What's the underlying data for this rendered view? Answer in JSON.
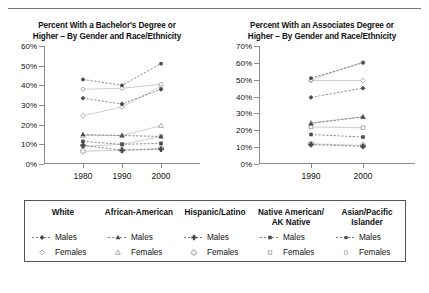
{
  "chart_data": [
    {
      "type": "line",
      "title": "Percent With a Bachelor's Degree or Higher – By Gender and Race/Ethnicity",
      "title_line1": "Percent With a Bachelor's Degree or",
      "title_line2": "Higher – By Gender and Race/Ethnicity",
      "xlabel": "",
      "ylabel": "",
      "x": [
        "1980",
        "1990",
        "2000"
      ],
      "ylim": [
        0,
        60
      ],
      "yticks": [
        0,
        10,
        20,
        30,
        40,
        50,
        60
      ],
      "ytick_labels": [
        "0%",
        "10%",
        "20%",
        "30%",
        "40%",
        "50%",
        "60%"
      ],
      "grid": false,
      "legend_position": "bottom-shared",
      "series": [
        {
          "name": "White Males",
          "group": "White",
          "gender": "Males",
          "marker": "diamond",
          "fill": "solid",
          "values": [
            33.5,
            30.5,
            38.0
          ]
        },
        {
          "name": "White Females",
          "group": "White",
          "gender": "Females",
          "marker": "diamond",
          "fill": "open",
          "values": [
            24.5,
            29.0,
            39.5
          ]
        },
        {
          "name": "African-American Males",
          "group": "African-American",
          "gender": "Males",
          "marker": "triangle",
          "fill": "solid",
          "values": [
            15.0,
            14.5,
            14.0
          ]
        },
        {
          "name": "African-American Females",
          "group": "African-American",
          "gender": "Females",
          "marker": "triangle",
          "fill": "open",
          "values": [
            14.5,
            14.5,
            19.5
          ]
        },
        {
          "name": "Hispanic/Latino Males",
          "group": "Hispanic/Latino",
          "gender": "Males",
          "marker": "cross",
          "fill": "solid",
          "values": [
            9.5,
            7.0,
            7.5
          ]
        },
        {
          "name": "Hispanic/Latino Females",
          "group": "Hispanic/Latino",
          "gender": "Females",
          "marker": "cross",
          "fill": "open",
          "values": [
            6.5,
            7.0,
            8.0
          ]
        },
        {
          "name": "Native American/AK Native Males",
          "group": "Native American/AK Native",
          "gender": "Males",
          "marker": "square",
          "fill": "solid",
          "values": [
            11.5,
            10.0,
            10.5
          ]
        },
        {
          "name": "Native American/AK Native Females",
          "group": "Native American/AK Native",
          "gender": "Females",
          "marker": "square",
          "fill": "open",
          "values": [
            9.0,
            10.0,
            14.0
          ]
        },
        {
          "name": "Asian/Pacific Islander Males",
          "group": "Asian/Pacific Islander",
          "gender": "Males",
          "marker": "circle",
          "fill": "solid",
          "values": [
            43.0,
            40.0,
            51.0
          ]
        },
        {
          "name": "Asian/Pacific Islander Females",
          "group": "Asian/Pacific Islander",
          "gender": "Females",
          "marker": "circle",
          "fill": "open",
          "values": [
            38.0,
            38.5,
            40.5
          ]
        }
      ]
    },
    {
      "type": "line",
      "title": "Percent With an Associates Degree or Higher – By Gender and Race/Ethnicity",
      "title_line1": "Percent With an Associates Degree or",
      "title_line2": "Higher – By Gender and Race/Ethnicity",
      "xlabel": "",
      "ylabel": "",
      "x": [
        "1990",
        "2000"
      ],
      "ylim": [
        0,
        70
      ],
      "yticks": [
        0,
        10,
        20,
        30,
        40,
        50,
        60,
        70
      ],
      "ytick_labels": [
        "0%",
        "10%",
        "20%",
        "30%",
        "40%",
        "50%",
        "60%",
        "70%"
      ],
      "grid": false,
      "legend_position": "bottom-shared",
      "series": [
        {
          "name": "White Males",
          "group": "White",
          "gender": "Males",
          "marker": "diamond",
          "fill": "solid",
          "values": [
            39.5,
            45.0
          ]
        },
        {
          "name": "White Females",
          "group": "White",
          "gender": "Females",
          "marker": "diamond",
          "fill": "open",
          "values": [
            49.5,
            49.5
          ]
        },
        {
          "name": "African-American Males",
          "group": "African-American",
          "gender": "Males",
          "marker": "triangle",
          "fill": "solid",
          "values": [
            24.0,
            28.0
          ]
        },
        {
          "name": "African-American Females",
          "group": "African-American",
          "gender": "Females",
          "marker": "triangle",
          "fill": "open",
          "values": [
            24.5,
            28.0
          ]
        },
        {
          "name": "Hispanic/Latino Males",
          "group": "Hispanic/Latino",
          "gender": "Males",
          "marker": "cross",
          "fill": "solid",
          "values": [
            11.5,
            10.5
          ]
        },
        {
          "name": "Hispanic/Latino Females",
          "group": "Hispanic/Latino",
          "gender": "Females",
          "marker": "cross",
          "fill": "open",
          "values": [
            12.0,
            11.0
          ]
        },
        {
          "name": "Native American/AK Native Males",
          "group": "Native American/AK Native",
          "gender": "Males",
          "marker": "square",
          "fill": "solid",
          "values": [
            17.5,
            16.0
          ]
        },
        {
          "name": "Native American/AK Native Females",
          "group": "Native American/AK Native",
          "gender": "Females",
          "marker": "square",
          "fill": "open",
          "values": [
            22.0,
            21.5
          ]
        },
        {
          "name": "Asian/Pacific Islander Males",
          "group": "Asian/Pacific Islander",
          "gender": "Males",
          "marker": "circle",
          "fill": "solid",
          "values": [
            51.0,
            60.0
          ]
        },
        {
          "name": "Asian/Pacific Islander Females",
          "group": "Asian/Pacific Islander",
          "gender": "Females",
          "marker": "circle",
          "fill": "open",
          "values": [
            50.0,
            60.5
          ]
        }
      ]
    }
  ],
  "legend": {
    "columns": [
      {
        "header": "White",
        "header_line1": "White",
        "header_line2": "",
        "marker": "diamond",
        "males_label": "Males",
        "females_label": "Females"
      },
      {
        "header": "African-American",
        "header_line1": "African-American",
        "header_line2": "",
        "marker": "triangle",
        "males_label": "Males",
        "females_label": "Females"
      },
      {
        "header": "Hispanic/Latino",
        "header_line1": "Hispanic/Latino",
        "header_line2": "",
        "marker": "cross",
        "males_label": "Males",
        "females_label": "Females"
      },
      {
        "header": "Native American/ AK Native",
        "header_line1": "Native American/",
        "header_line2": "AK Native",
        "marker": "square",
        "males_label": "Males",
        "females_label": "Females"
      },
      {
        "header": "Asian/Pacific Islander",
        "header_line1": "Asian/Pacific",
        "header_line2": "Islander",
        "marker": "circle",
        "males_label": "Males",
        "females_label": "Females"
      }
    ]
  },
  "colors": {
    "axis": "#8a8a8a",
    "text": "#111111",
    "marker_dark": "#4a4a4a",
    "marker_light": "#a8a8a8",
    "line_dark": "#6e6e6e",
    "line_light": "#c0c0c0",
    "legend_border": "#555555"
  }
}
